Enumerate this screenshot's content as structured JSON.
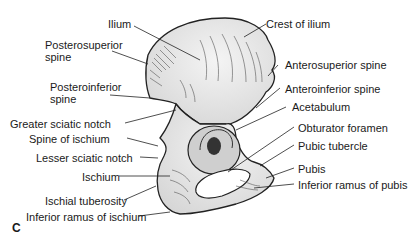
{
  "figure": {
    "panel_label": "C",
    "labels": [
      {
        "id": "ilium",
        "text": "Ilium"
      },
      {
        "id": "crest_of_ilium",
        "text": "Crest of ilium"
      },
      {
        "id": "posterosuperior_spine_1",
        "text": "Posterosuperior"
      },
      {
        "id": "posterosuperior_spine_2",
        "text": "spine"
      },
      {
        "id": "anterosuperior_spine",
        "text": "Anterosuperior spine"
      },
      {
        "id": "posteroinferior_spine_1",
        "text": "Posteroinferior"
      },
      {
        "id": "posteroinferior_spine_2",
        "text": "spine"
      },
      {
        "id": "anteroinferior_spine",
        "text": "Anteroinferior spine"
      },
      {
        "id": "acetabulum",
        "text": "Acetabulum"
      },
      {
        "id": "greater_sciatic_notch",
        "text": "Greater sciatic notch"
      },
      {
        "id": "spine_of_ischium",
        "text": "Spine of ischium"
      },
      {
        "id": "obturator_foramen",
        "text": "Obturator foramen"
      },
      {
        "id": "pubic_tubercle",
        "text": "Pubic tubercle"
      },
      {
        "id": "lesser_sciatic_notch",
        "text": "Lesser sciatic notch"
      },
      {
        "id": "ischium",
        "text": "Ischium"
      },
      {
        "id": "pubis",
        "text": "Pubis"
      },
      {
        "id": "inferior_ramus_of_pubis",
        "text": "Inferior ramus of pubis"
      },
      {
        "id": "ischial_tuberosity",
        "text": "Ischial tuberosity"
      },
      {
        "id": "inferior_ramus_of_ischium",
        "text": "Inferior ramus of ischium"
      }
    ]
  }
}
